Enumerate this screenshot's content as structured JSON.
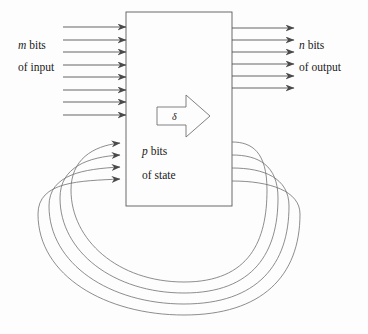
{
  "figure": {
    "background_color": "#fdfdfd",
    "line_color": "#3a3a3a",
    "curve_color": "#6e6e6e",
    "text_color": "#1a1a1a"
  },
  "labels": {
    "input": {
      "symbol": "m",
      "line1_suffix": " bits",
      "line2": "of input"
    },
    "output": {
      "symbol": "n",
      "line1_suffix": " bits",
      "line2": "of output"
    },
    "state": {
      "symbol": "p",
      "line1_suffix": " bits",
      "line2": "of state"
    },
    "transition_function": "δ"
  },
  "block": {
    "name": "logic-block",
    "x": 126,
    "y": 12,
    "width": 106,
    "height": 194
  },
  "arrows": {
    "input": {
      "count": 8,
      "start_x": 63,
      "end_x": 126,
      "y_positions": [
        27,
        40,
        52,
        65,
        77,
        90,
        102,
        115
      ]
    },
    "output": {
      "count": 6,
      "start_x": 232,
      "end_x": 294,
      "y_positions": [
        28,
        40,
        52,
        64,
        76,
        88
      ]
    },
    "feedback": {
      "count": 4,
      "exit_x": 232,
      "entry_x": 126,
      "exit_y_positions": [
        142,
        155,
        168,
        181
      ],
      "entry_y_positions": [
        143,
        155,
        167,
        179
      ],
      "loop_bottom_y": [
        282,
        293,
        304,
        315
      ],
      "loop_left_x": [
        71,
        60,
        49,
        38
      ],
      "loop_right_x": [
        267,
        278,
        289,
        300
      ]
    }
  },
  "delta_arrow": {
    "name": "state-transition-arrow",
    "x": 157,
    "y": 95,
    "width": 53,
    "height": 42
  }
}
